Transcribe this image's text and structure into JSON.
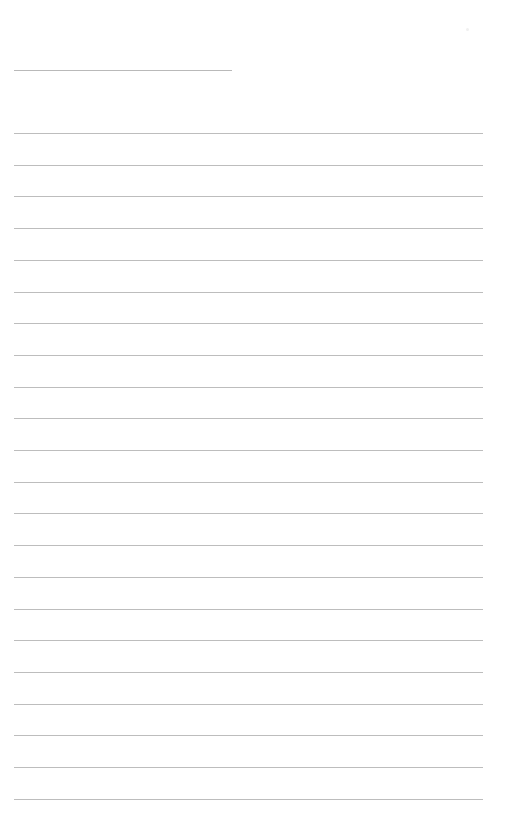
{
  "page": {
    "type": "lined-writing-page",
    "background_color": "#ffffff",
    "line_color": "#bdbdbd",
    "title_line": {
      "present": true
    },
    "ruled_lines": {
      "count": 22,
      "first_y": 133,
      "spacing": 31.7
    },
    "text_content": ""
  }
}
